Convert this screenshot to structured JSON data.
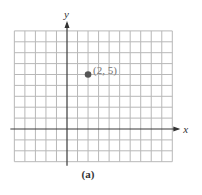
{
  "figure": {
    "caption": "(a)",
    "x_axis_label": "x",
    "y_axis_label": "y",
    "point_label": "(2, 5)",
    "colors": {
      "grid": "#b8b8b8",
      "axis": "#3a3a3a",
      "point": "#555555",
      "point_label": "#777777"
    }
  },
  "chart_data": {
    "type": "scatter",
    "title": "",
    "xlabel": "x",
    "ylabel": "y",
    "xlim": [
      -5,
      10
    ],
    "ylim": [
      -3,
      9
    ],
    "grid": true,
    "grid_spacing": 1,
    "tick_labels_shown": false,
    "points": [
      {
        "x": 2,
        "y": 5,
        "label": "(2, 5)"
      }
    ],
    "caption": "(a)"
  }
}
